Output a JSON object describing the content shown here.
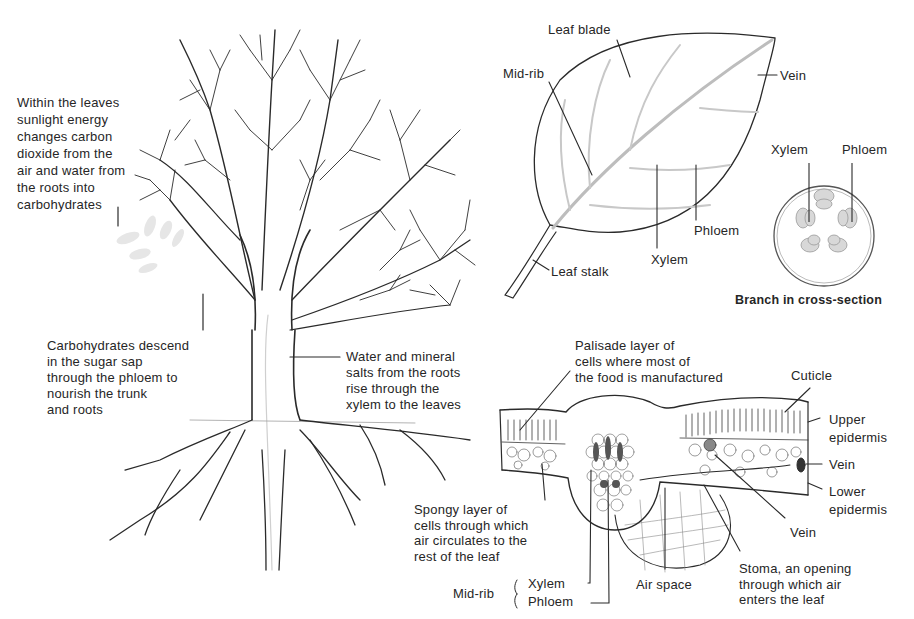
{
  "tree": {
    "photosynthesis_note": "Within the leaves\nsunlight energy\nchanges carbon\ndioxide from the\nair and water from\nthe roots into\ncarbohydrates",
    "phloem_note": "Carbohydrates descend\nin the sugar sap\nthrough the phloem to\nnourish the trunk\nand roots",
    "xylem_note": "Water and mineral\nsalts from the roots\nrise through the\nxylem to the leaves"
  },
  "leaf": {
    "leaf_blade": "Leaf blade",
    "mid_rib": "Mid-rib",
    "vein": "Vein",
    "phloem": "Phloem",
    "xylem": "Xylem",
    "leaf_stalk": "Leaf stalk"
  },
  "branch_section": {
    "xylem": "Xylem",
    "phloem": "Phloem",
    "caption": "Branch in cross-section"
  },
  "leaf_section": {
    "palisade": "Palisade layer of\ncells where most of\nthe food is manufactured",
    "cuticle": "Cuticle",
    "upper_epidermis": "Upper\nepidermis",
    "vein_right": "Vein",
    "lower_epidermis": "Lower\nepidermis",
    "vein_bottom": "Vein",
    "spongy": "Spongy layer of\ncells through which\nair circulates to the\nrest of the leaf",
    "midrib_label": "Mid-rib",
    "midrib_xylem": "Xylem",
    "midrib_phloem": "Phloem",
    "air_space": "Air space",
    "stoma": "Stoma, an opening\nthrough which air\nenters the leaf"
  },
  "colors": {
    "line": "#2a2a2a",
    "faint": "#bdbdbd",
    "bundle_fill": "#d8d8d8",
    "text": "#262626"
  }
}
